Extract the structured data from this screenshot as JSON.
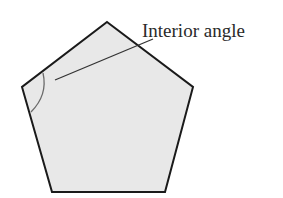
{
  "diagram": {
    "shape": "regular-pentagon",
    "fill_color": "#e8e8e8",
    "stroke_color": "#1a1a1a",
    "arc_color": "#6a6a6a",
    "leader_color": "#333333",
    "label": "Interior angle"
  }
}
